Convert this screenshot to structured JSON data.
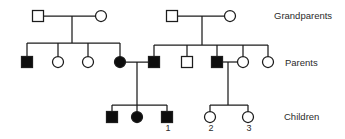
{
  "figure": {
    "type": "pedigree-chart",
    "background": "#ffffff",
    "line_color": "#1c1c1c",
    "affected_fill": "#0d0d0d",
    "unaffected_fill": "#ffffff",
    "text_color": "#2b2b2b"
  },
  "generation_labels": {
    "grandparents": "Grandparents",
    "parents": "Parents",
    "children": "Children"
  },
  "pedigree": {
    "legend_note": "filled = affected, open = unaffected; square = male, circle = female",
    "individuals": [
      {
        "id": "I-1",
        "sex": "male",
        "affected": false,
        "x": 38,
        "y": 16
      },
      {
        "id": "I-2",
        "sex": "female",
        "affected": false,
        "x": 101,
        "y": 16
      },
      {
        "id": "I-3",
        "sex": "male",
        "affected": false,
        "x": 172,
        "y": 16
      },
      {
        "id": "I-4",
        "sex": "female",
        "affected": false,
        "x": 230,
        "y": 16
      },
      {
        "id": "II-1",
        "sex": "male",
        "affected": true,
        "x": 27,
        "y": 62
      },
      {
        "id": "II-2",
        "sex": "female",
        "affected": false,
        "x": 58,
        "y": 62
      },
      {
        "id": "II-3",
        "sex": "female",
        "affected": false,
        "x": 88,
        "y": 62
      },
      {
        "id": "II-4",
        "sex": "female",
        "affected": true,
        "x": 120,
        "y": 62
      },
      {
        "id": "II-5",
        "sex": "male",
        "affected": true,
        "x": 154,
        "y": 62
      },
      {
        "id": "II-6",
        "sex": "male",
        "affected": false,
        "x": 187,
        "y": 62
      },
      {
        "id": "II-7",
        "sex": "male",
        "affected": true,
        "x": 217,
        "y": 62
      },
      {
        "id": "II-8",
        "sex": "female",
        "affected": false,
        "x": 243,
        "y": 62
      },
      {
        "id": "II-9",
        "sex": "female",
        "affected": false,
        "x": 268,
        "y": 62
      },
      {
        "id": "III-1",
        "sex": "male",
        "affected": true,
        "x": 112,
        "y": 117
      },
      {
        "id": "III-2",
        "sex": "female",
        "affected": true,
        "x": 137,
        "y": 117
      },
      {
        "id": "III-3",
        "sex": "male",
        "affected": true,
        "x": 167,
        "y": 117,
        "label": "1"
      },
      {
        "id": "III-4",
        "sex": "female",
        "affected": false,
        "x": 210,
        "y": 117,
        "label": "2"
      },
      {
        "id": "III-5",
        "sex": "female",
        "affected": false,
        "x": 248,
        "y": 117,
        "label": "3"
      }
    ],
    "unions": [
      {
        "partners": [
          "I-1",
          "I-2"
        ],
        "children": [
          "II-1",
          "II-2",
          "II-3",
          "II-4"
        ]
      },
      {
        "partners": [
          "I-3",
          "I-4"
        ],
        "children": [
          "II-5",
          "II-6",
          "II-7",
          "II-8",
          "II-9"
        ]
      },
      {
        "partners": [
          "II-4",
          "II-5"
        ],
        "children": [
          "III-1",
          "III-2",
          "III-3"
        ]
      },
      {
        "partners": [
          "II-7",
          "II-8"
        ],
        "children": [
          "III-4",
          "III-5"
        ]
      }
    ],
    "segments": [
      {
        "x1": 38,
        "y1": 16,
        "x2": 101,
        "y2": 16
      },
      {
        "x1": 72,
        "y1": 16,
        "x2": 72,
        "y2": 43
      },
      {
        "x1": 27,
        "y1": 43,
        "x2": 120,
        "y2": 43
      },
      {
        "x1": 27,
        "y1": 43,
        "x2": 27,
        "y2": 62
      },
      {
        "x1": 58,
        "y1": 43,
        "x2": 58,
        "y2": 62
      },
      {
        "x1": 88,
        "y1": 43,
        "x2": 88,
        "y2": 62
      },
      {
        "x1": 120,
        "y1": 43,
        "x2": 120,
        "y2": 62
      },
      {
        "x1": 172,
        "y1": 16,
        "x2": 230,
        "y2": 16
      },
      {
        "x1": 202,
        "y1": 16,
        "x2": 202,
        "y2": 45
      },
      {
        "x1": 154,
        "y1": 45,
        "x2": 268,
        "y2": 45
      },
      {
        "x1": 154,
        "y1": 45,
        "x2": 154,
        "y2": 62
      },
      {
        "x1": 187,
        "y1": 45,
        "x2": 187,
        "y2": 62
      },
      {
        "x1": 217,
        "y1": 45,
        "x2": 217,
        "y2": 62
      },
      {
        "x1": 243,
        "y1": 45,
        "x2": 243,
        "y2": 62
      },
      {
        "x1": 268,
        "y1": 45,
        "x2": 268,
        "y2": 62
      },
      {
        "x1": 120,
        "y1": 62,
        "x2": 154,
        "y2": 62
      },
      {
        "x1": 137,
        "y1": 62,
        "x2": 137,
        "y2": 105
      },
      {
        "x1": 112,
        "y1": 105,
        "x2": 167,
        "y2": 105
      },
      {
        "x1": 112,
        "y1": 105,
        "x2": 112,
        "y2": 117
      },
      {
        "x1": 137,
        "y1": 105,
        "x2": 137,
        "y2": 117
      },
      {
        "x1": 167,
        "y1": 105,
        "x2": 167,
        "y2": 117
      },
      {
        "x1": 217,
        "y1": 62,
        "x2": 243,
        "y2": 62
      },
      {
        "x1": 228,
        "y1": 62,
        "x2": 228,
        "y2": 105
      },
      {
        "x1": 210,
        "y1": 105,
        "x2": 248,
        "y2": 105
      },
      {
        "x1": 210,
        "y1": 105,
        "x2": 210,
        "y2": 117
      },
      {
        "x1": 248,
        "y1": 105,
        "x2": 248,
        "y2": 117
      }
    ]
  }
}
